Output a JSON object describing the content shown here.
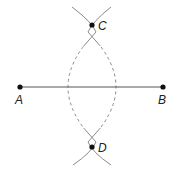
{
  "diagram": {
    "points": [
      {
        "id": "A",
        "label": "A",
        "x": 20,
        "y": 87
      },
      {
        "id": "B",
        "label": "B",
        "x": 163,
        "y": 87
      },
      {
        "id": "C",
        "label": "C",
        "x": 92,
        "y": 25
      },
      {
        "id": "D",
        "label": "D",
        "x": 92,
        "y": 147
      }
    ],
    "segments": [
      {
        "from": "A",
        "to": "B",
        "style": "solid"
      }
    ],
    "arcs": [
      {
        "center": "B",
        "style": "solid-ends-dashed-middle"
      },
      {
        "center": "A",
        "style": "solid-ends-dashed-middle"
      }
    ],
    "labels": {
      "A": "A",
      "B": "B",
      "C": "C",
      "D": "D"
    },
    "colors": {
      "line": "#555555",
      "arc": "#8a8a8a",
      "point": "#111111",
      "label": "#222222"
    }
  }
}
